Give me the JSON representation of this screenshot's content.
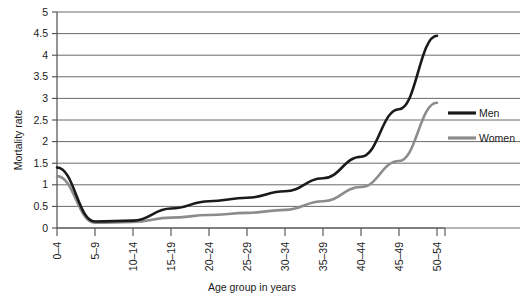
{
  "chart_data": {
    "type": "line",
    "title": "",
    "xlabel": "Age group in years",
    "ylabel": "Mortality rate",
    "categories": [
      "0–4",
      "5–9",
      "10–14",
      "15–19",
      "20–24",
      "25–29",
      "30–34",
      "35–39",
      "40–44",
      "45–49",
      "50–54"
    ],
    "ylim": [
      0,
      5
    ],
    "ytick_step": 0.5,
    "yticks": [
      "0",
      "0.5",
      "1",
      "1.5",
      "2",
      "2.5",
      "3",
      "3.5",
      "4",
      "4.5",
      "5"
    ],
    "grid": "horizontal",
    "legend_position": "right",
    "series": [
      {
        "name": "Men",
        "color": "#1a1a1a",
        "values": [
          1.4,
          0.15,
          0.17,
          0.45,
          0.62,
          0.7,
          0.85,
          1.15,
          1.65,
          2.75,
          4.45
        ]
      },
      {
        "name": "Women",
        "color": "#8c8c8c",
        "values": [
          1.2,
          0.12,
          0.14,
          0.24,
          0.3,
          0.35,
          0.42,
          0.62,
          0.95,
          1.55,
          2.9
        ]
      }
    ]
  },
  "axes": {
    "y_title": "Mortality rate",
    "x_title": "Age group in years"
  },
  "legend": {
    "items": [
      {
        "label": "Men",
        "color": "#1a1a1a"
      },
      {
        "label": "Women",
        "color": "#8c8c8c"
      }
    ]
  },
  "colors": {
    "men": "#1a1a1a",
    "women": "#8c8c8c",
    "grid": "#595959",
    "axis": "#4d4d4d",
    "background": "#ffffff"
  }
}
